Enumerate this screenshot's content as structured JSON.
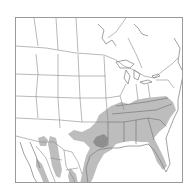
{
  "map": {
    "type": "range-map",
    "region": "North America (US, southern Canada, northern Mexico)",
    "legend": [],
    "colors": {
      "background": "#ffffff",
      "border_lines": "#8a8a8a",
      "frame": "#9a9a9a",
      "range_fill": "#bdbdbd",
      "core_fill": "#8f8f8f"
    },
    "layers": [
      {
        "name": "range",
        "description": "Light gray distribution across southeastern US and east Texas, plus Mexican Gulf coast and western Mexico highlands"
      },
      {
        "name": "core",
        "description": "Darker gray core area around northeast Texas / northwest Louisiana"
      }
    ]
  }
}
